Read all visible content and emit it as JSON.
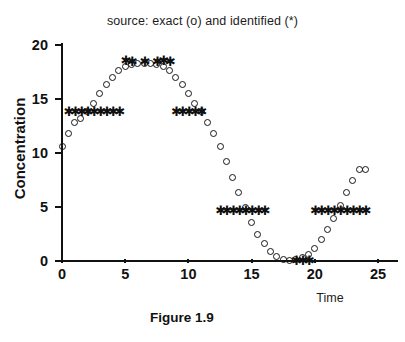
{
  "chart_data": {
    "type": "scatter",
    "title": "source: exact (o) and identified (*)",
    "xlabel": "Time",
    "ylabel": "Concentration",
    "caption": "Figure 1.9",
    "xlim": [
      0,
      26.5
    ],
    "ylim": [
      -0.6,
      20.8
    ],
    "xticks": [
      0,
      5,
      10,
      15,
      20,
      25
    ],
    "yticks": [
      0,
      5,
      10,
      15,
      20
    ],
    "xtick_labels": [
      "0",
      "5",
      "10",
      "15",
      "20",
      "25"
    ],
    "ytick_labels": [
      "0",
      "5",
      "10",
      "15",
      "20"
    ],
    "grid": false,
    "legend_position": "in-title",
    "series": [
      {
        "name": "exact",
        "marker": "o",
        "marker_label": "circle",
        "x": [
          0.0,
          0.5,
          1.0,
          1.5,
          2.0,
          2.5,
          3.0,
          3.5,
          4.0,
          4.5,
          5.0,
          5.5,
          6.0,
          6.5,
          7.0,
          7.5,
          8.0,
          8.5,
          9.0,
          9.5,
          10.0,
          10.5,
          11.0,
          11.5,
          12.0,
          12.5,
          13.0,
          13.5,
          14.0,
          14.5,
          15.0,
          15.5,
          16.0,
          16.5,
          17.0,
          17.5,
          18.0,
          18.5,
          19.0,
          19.5,
          20.0,
          20.5,
          21.0,
          21.5,
          22.0,
          22.5,
          23.0,
          23.5,
          24.0
        ],
        "y": [
          10.6,
          11.8,
          12.8,
          13.2,
          13.8,
          14.6,
          15.5,
          16.3,
          17.0,
          17.6,
          18.0,
          18.2,
          18.3,
          18.3,
          18.3,
          18.2,
          18.0,
          17.6,
          17.0,
          16.3,
          15.5,
          14.6,
          13.8,
          12.8,
          11.8,
          10.6,
          9.2,
          7.7,
          6.3,
          5.0,
          3.6,
          2.5,
          1.6,
          0.9,
          0.4,
          0.15,
          0.05,
          0.1,
          0.3,
          0.6,
          1.2,
          2.0,
          2.9,
          3.9,
          5.1,
          6.3,
          7.5,
          8.5,
          8.5
        ]
      },
      {
        "name": "identified",
        "marker": "*",
        "marker_label": "asterisk",
        "x": [
          0.5,
          1.0,
          1.5,
          2.0,
          2.5,
          3.0,
          3.5,
          4.0,
          4.5,
          5.0,
          5.5,
          6.5,
          7.5,
          8.0,
          8.5,
          9.0,
          9.5,
          10.0,
          10.5,
          11.0,
          12.5,
          13.0,
          13.5,
          14.0,
          14.5,
          15.0,
          15.5,
          16.0,
          18.5,
          19.0,
          19.5,
          20.0,
          20.5,
          21.0,
          21.5,
          22.0,
          22.5,
          23.0,
          23.5,
          24.0
        ],
        "y": [
          13.8,
          13.8,
          13.8,
          13.8,
          13.8,
          13.8,
          13.8,
          13.8,
          13.8,
          18.6,
          18.5,
          18.5,
          18.5,
          18.6,
          18.5,
          13.8,
          13.8,
          13.8,
          13.8,
          13.8,
          4.7,
          4.7,
          4.7,
          4.7,
          4.7,
          4.7,
          4.7,
          4.7,
          0.05,
          0.05,
          0.05,
          4.7,
          4.7,
          4.7,
          4.7,
          4.7,
          4.7,
          4.7,
          4.7,
          4.7
        ]
      }
    ],
    "annotations": [
      {
        "text": "asterisk cluster near y=13.8 on rising limb (t=0.5..4.5)"
      },
      {
        "text": "asterisk cluster near y=18.5 at the peak (t=5..8.5)"
      },
      {
        "text": "asterisk cluster near y=13.8 on falling limb (t=9..11)"
      },
      {
        "text": "asterisk cluster near y=4.7 on falling limb (t=12.5..16)"
      },
      {
        "text": "asterisk cluster near y=0 in the trough (t=18.5..19.5)"
      },
      {
        "text": "asterisk cluster near y=4.7 on second rising limb (t=20..24)"
      }
    ]
  },
  "colors": {
    "axis": "#111111",
    "marker": "#151515",
    "background": "#ffffff"
  }
}
